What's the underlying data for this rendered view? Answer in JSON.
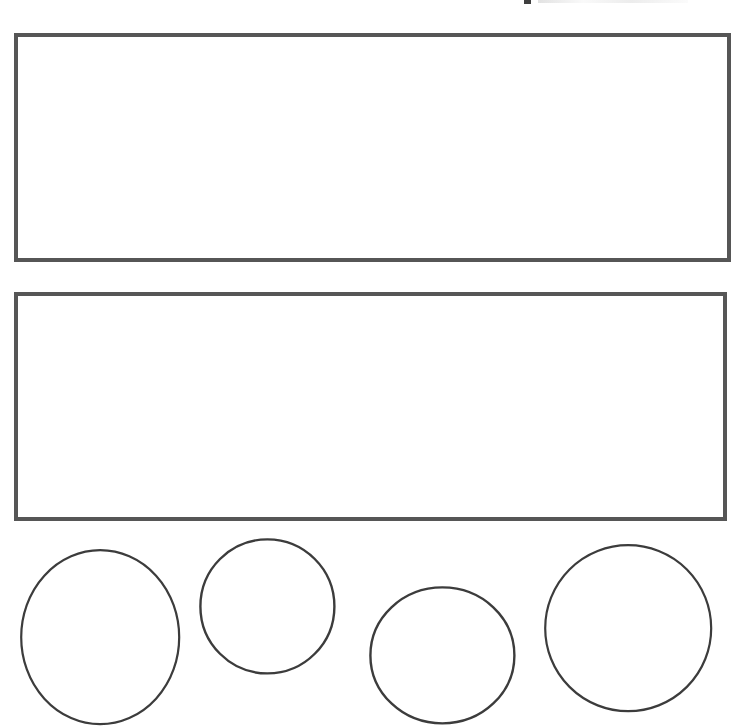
{
  "document": {
    "title": "Geometric Shape Worksheet",
    "background_color": "#ffffff",
    "width": 737,
    "height": 728
  },
  "header_remnant": {
    "description": "clipped text fragment at top edge",
    "visible_text": "",
    "color": "#3f3f3f"
  },
  "shapes": {
    "stroke_color_rectangle": "#565656",
    "stroke_color_circle": "#3c3c3c",
    "fill_color": "#ffffff",
    "rectangles": [
      {
        "name": "upper-rectangle",
        "x": 14,
        "y": 33,
        "width": 717,
        "height": 229,
        "stroke_width": 4
      },
      {
        "name": "lower-rectangle",
        "x": 14,
        "y": 292,
        "width": 713,
        "height": 229,
        "stroke_width": 4
      }
    ],
    "circles": [
      {
        "name": "circle-1",
        "cx": 100,
        "cy": 637,
        "rx": 79,
        "ry": 87,
        "stroke_width": 2.2
      },
      {
        "name": "circle-2",
        "cx": 267,
        "cy": 606,
        "rx": 67,
        "ry": 67,
        "stroke_width": 2.4
      },
      {
        "name": "circle-3",
        "cx": 442,
        "cy": 655,
        "rx": 72,
        "ry": 68,
        "stroke_width": 2.4
      },
      {
        "name": "circle-4",
        "cx": 628,
        "cy": 628,
        "rx": 83,
        "ry": 83,
        "stroke_width": 2.2
      }
    ]
  }
}
